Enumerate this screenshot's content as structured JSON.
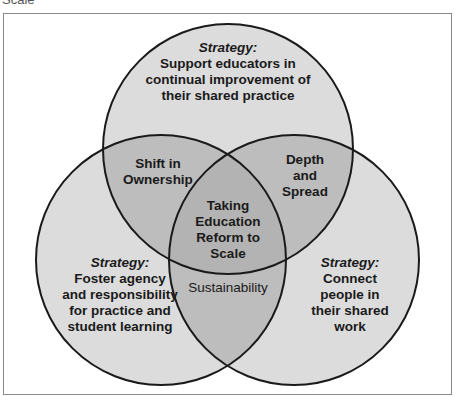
{
  "caption_fragment": "Scale",
  "diagram": {
    "type": "venn",
    "colors": {
      "circle_fill": "#dcdcdc",
      "pair_overlap_fill": "#bdbdbd",
      "center_fill": "#b3b3b3",
      "stroke": "#1a1a1a",
      "frame": "#8a8a8a"
    },
    "circles": {
      "top": {
        "heading": "Strategy:",
        "lines": [
          "Support educators in",
          "continual improvement of",
          "their shared practice"
        ]
      },
      "left": {
        "heading": "Strategy:",
        "lines": [
          "Foster agency",
          "and responsibility",
          "for practice and",
          "student learning"
        ]
      },
      "right": {
        "heading": "Strategy:",
        "lines": [
          "Connect",
          "people in",
          "their shared",
          "work"
        ]
      }
    },
    "overlaps": {
      "top_left": [
        "Shift in",
        "Ownership"
      ],
      "top_right": [
        "Depth",
        "and",
        "Spread"
      ],
      "left_right": [
        "Sustainability"
      ],
      "center": [
        "Taking",
        "Education",
        "Reform to",
        "Scale"
      ]
    }
  }
}
